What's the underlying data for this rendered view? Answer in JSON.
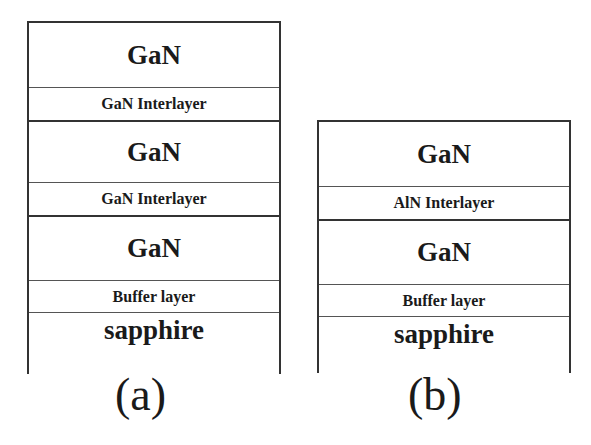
{
  "figure": {
    "panels": [
      {
        "id": "a",
        "caption": "(a)",
        "layers": [
          {
            "label": "GaN",
            "type": "main"
          },
          {
            "label": "GaN Interlayer",
            "type": "interlayer"
          },
          {
            "label": "GaN",
            "type": "main"
          },
          {
            "label": "GaN Interlayer",
            "type": "interlayer"
          },
          {
            "label": "GaN",
            "type": "main"
          },
          {
            "label": "Buffer layer",
            "type": "interlayer"
          },
          {
            "label": "sapphire",
            "type": "substrate"
          }
        ]
      },
      {
        "id": "b",
        "caption": "(b)",
        "layers": [
          {
            "label": "GaN",
            "type": "main"
          },
          {
            "label": "AlN Interlayer",
            "type": "interlayer"
          },
          {
            "label": "GaN",
            "type": "main"
          },
          {
            "label": "Buffer layer",
            "type": "interlayer"
          },
          {
            "label": "sapphire",
            "type": "substrate"
          }
        ]
      }
    ],
    "colors": {
      "line": "#333333",
      "text": "#1a1a1a",
      "background": "#ffffff"
    }
  }
}
